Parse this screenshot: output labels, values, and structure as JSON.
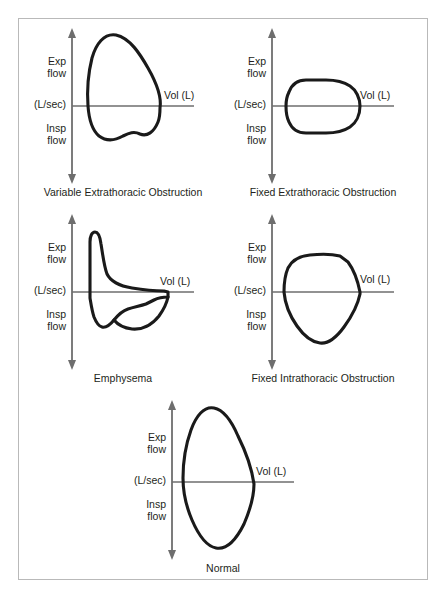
{
  "figure": {
    "axis_labels": {
      "exp_line1": "Exp",
      "exp_line2": "flow",
      "origin": "(L/sec)",
      "insp_line1": "Insp",
      "insp_line2": "flow",
      "volume": "Vol (L)"
    },
    "colors": {
      "curve": "#1a1a1a",
      "axis": "#6e6e6e",
      "border": "#b9b9b9",
      "background": "#ffffff",
      "text": "#231f20"
    },
    "panels": [
      {
        "id": "variable-extrathoracic-obstruction",
        "caption": "Variable Extrathoracic Obstruction",
        "description": "Expiratory limb near normal; inspiratory limb flattened / plateaued"
      },
      {
        "id": "fixed-extrathoracic-obstruction",
        "caption": "Fixed Extrathoracic Obstruction",
        "description": "Both expiratory and inspiratory limbs flattened symmetrically, box-shaped loop"
      },
      {
        "id": "emphysema",
        "caption": "Emphysema",
        "description": "Tall narrow expiratory peak with concave scooped descending limb; reduced inspiratory flow"
      },
      {
        "id": "fixed-intrathoracic-obstruction",
        "caption": "Fixed Intrathoracic Obstruction",
        "description": "Expiratory limb flattened / plateaued; inspiratory limb preserved"
      },
      {
        "id": "normal",
        "caption": "Normal",
        "description": "Rapid rise to peak expiratory flow with linear descent; rounded inspiratory limb"
      }
    ]
  },
  "caption": {
    "text": ""
  }
}
